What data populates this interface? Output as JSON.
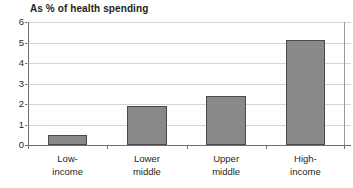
{
  "chart_data": {
    "type": "bar",
    "title": "As % of health spending",
    "xlabel": "",
    "ylabel": "",
    "categories": [
      "Low-income",
      "Lower middle",
      "Upper middle",
      "High-income"
    ],
    "category_lines": [
      [
        "Low-",
        "income"
      ],
      [
        "Lower",
        "middle"
      ],
      [
        "Upper",
        "middle"
      ],
      [
        "High-",
        "income"
      ]
    ],
    "values": [
      0.5,
      1.9,
      2.4,
      5.1
    ],
    "ylim": [
      0,
      6
    ],
    "yticks": [
      0,
      1,
      2,
      3,
      4,
      5,
      6
    ],
    "ytick_labels": [
      "0",
      "1",
      "2",
      "3",
      "4",
      "5",
      "6"
    ],
    "grid": true,
    "legend": false,
    "legend_position": "none",
    "colors": {
      "bar_fill": "#898989",
      "bar_border": "#4a4a4a",
      "gridline": "#d6d6d6",
      "axis": "#6f6f6f",
      "text": "#231f20",
      "background": "#ffffff"
    }
  }
}
